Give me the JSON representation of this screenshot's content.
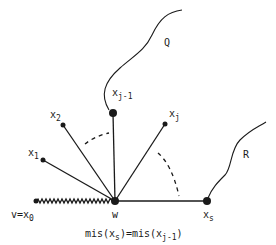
{
  "diagram": {
    "nodes": {
      "x0": {
        "label": "v=x",
        "sub": "0"
      },
      "x1": {
        "label": "x",
        "sub": "1"
      },
      "x2": {
        "label": "x",
        "sub": "2"
      },
      "xj1": {
        "label": "x",
        "sub": "j-1"
      },
      "xj": {
        "label": "x",
        "sub": "j"
      },
      "xs": {
        "label": "x",
        "sub": "s"
      },
      "w": {
        "label": "w"
      }
    },
    "paths": {
      "Q": "Q",
      "R": "R"
    },
    "caption": {
      "pre": "mis(x",
      "sub1": "s",
      "mid": ")=mis(x",
      "sub2": "j-1",
      "post": ")"
    },
    "colors": {
      "ink": "#1a1a1a",
      "background": "#ffffff"
    }
  }
}
